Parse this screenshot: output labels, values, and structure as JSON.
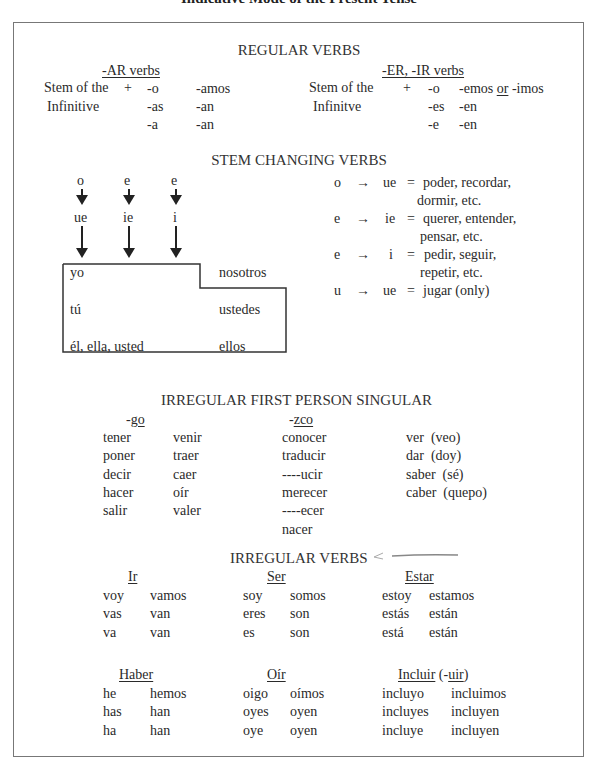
{
  "title": "Indicative Mode of the Present Tense",
  "regular": {
    "heading": "REGULAR VERBS",
    "ar": {
      "label": "-AR verbs",
      "stem1": "Stem of the",
      "stem2": "Infinitive",
      "plus": "+",
      "singular": [
        "-o",
        "-as",
        "-a"
      ],
      "plural": [
        "-amos",
        "-an",
        "-an"
      ]
    },
    "er_ir": {
      "label": "-ER, -IR verbs",
      "stem1": "Stem of the",
      "stem2": "Infinitve",
      "plus": "+",
      "singular": [
        "-o",
        "-es",
        "-e"
      ],
      "plural_first_a": "-emos",
      "plural_first_or": "or",
      "plural_first_b": "-imos",
      "plural": [
        "-en",
        "-en"
      ]
    }
  },
  "stem_changing": {
    "heading": "STEM CHANGING VERBS",
    "diagram": {
      "from": [
        "o",
        "e",
        "e"
      ],
      "to": [
        "ue",
        "ie",
        "i"
      ],
      "persons": {
        "yo": "yo",
        "tu": "tú",
        "el": "él, ella, usted",
        "nosotros": "nosotros",
        "ustedes": "ustedes",
        "ellos": "ellos"
      }
    },
    "rules": [
      {
        "from": "o",
        "arrow": "→",
        "to": "ue",
        "eq": "=",
        "line1": "poder, recordar,",
        "line2": "dormir, etc."
      },
      {
        "from": "e",
        "arrow": "→",
        "to": "ie",
        "eq": "=",
        "line1": "querer, entender,",
        "line2": "pensar, etc."
      },
      {
        "from": "e",
        "arrow": "→",
        "to": "i",
        "eq": "=",
        "line1": "pedir, seguir,",
        "line2": "repetir, etc."
      },
      {
        "from": "u",
        "arrow": "→",
        "to": "ue",
        "eq": "=",
        "line1": "jugar (only)",
        "line2": ""
      }
    ]
  },
  "first_person": {
    "heading": "IRREGULAR FIRST PERSON SINGULAR",
    "go_label_dash": "-",
    "go_label": "go",
    "go_col1": [
      "tener",
      "poner",
      "decir",
      "hacer",
      "salir"
    ],
    "go_col2": [
      "venir",
      "traer",
      "caer",
      "oír",
      "valer"
    ],
    "zco_label_dash": "-",
    "zco_label": "zco",
    "zco": [
      "conocer",
      "traducir",
      "----ucir",
      "merecer",
      "----ecer",
      "nacer"
    ],
    "other": [
      "ver  (veo)",
      "dar  (doy)",
      "saber  (sé)",
      "caber  (quepo)"
    ]
  },
  "irregular": {
    "heading": "IRREGULAR VERBS",
    "verbs": [
      {
        "name": "Ir",
        "sing": [
          "voy",
          "vas",
          "va"
        ],
        "plur": [
          "vamos",
          "van",
          "van"
        ]
      },
      {
        "name": "Ser",
        "sing": [
          "soy",
          "eres",
          "es"
        ],
        "plur": [
          "somos",
          "son",
          "son"
        ]
      },
      {
        "name": "Estar",
        "sing": [
          "estoy",
          "estás",
          "está"
        ],
        "plur": [
          "estamos",
          "están",
          "están"
        ]
      },
      {
        "name": "Haber",
        "sing": [
          "he",
          "has",
          "ha"
        ],
        "plur": [
          "hemos",
          "han",
          "han"
        ]
      },
      {
        "name": "Oír",
        "sing": [
          "oigo",
          "oyes",
          "oye"
        ],
        "plur": [
          "oímos",
          "oyen",
          "oyen"
        ]
      },
      {
        "name": "Incluir",
        "suffix_open": " (-",
        "suffix": "uir",
        "suffix_close": ")",
        "sing": [
          "incluyo",
          "incluyes",
          "incluye"
        ],
        "plur": [
          "incluimos",
          "incluyen",
          "incluyen"
        ]
      }
    ]
  }
}
